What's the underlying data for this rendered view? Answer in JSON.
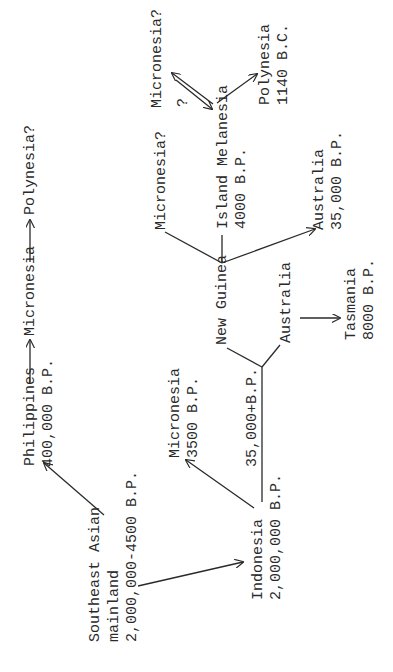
{
  "diagram": {
    "orientation": "rotated 90 degrees counter-clockwise",
    "nodes": {
      "polynesia_q": {
        "label": "Polynesia?"
      },
      "micronesia_chain": {
        "label": "Micronesia"
      },
      "philippines": {
        "label": "Philippines",
        "date": "400,000 B.P."
      },
      "se_asia": {
        "line1": "Southeast Asian",
        "line2": "mainland",
        "date": "2,000,000-4500 B.P."
      },
      "indonesia": {
        "label": "Indonesia",
        "date": "2,000,000 B.P."
      },
      "micronesia_3500": {
        "label": "Micronesia",
        "date": "3500 B.P."
      },
      "edge_35000": {
        "label": "35,000+B.P."
      },
      "new_guinea": {
        "label": "New Guinea"
      },
      "australia_branch": {
        "label": "Australia"
      },
      "tasmania": {
        "label": "Tasmania",
        "date": "8000 B.P."
      },
      "micronesia_q_mid": {
        "label": "Micronesia?"
      },
      "island_melanesia": {
        "label": "Island Melanesia",
        "date": "4000 B.P."
      },
      "australia_35000": {
        "label": "Australia",
        "date": "35,000 B.P."
      },
      "micronesia_q_top": {
        "label": "Micronesia?"
      },
      "question_mark": {
        "label": "?"
      },
      "polynesia_1140": {
        "label": "Polynesia",
        "date": "1140 B.C."
      }
    },
    "edges": [
      {
        "from": "Southeast Asian mainland",
        "to": "Philippines"
      },
      {
        "from": "Southeast Asian mainland",
        "to": "Indonesia"
      },
      {
        "from": "Philippines",
        "to": "Micronesia"
      },
      {
        "from": "Micronesia",
        "to": "Polynesia?"
      },
      {
        "from": "Indonesia",
        "to": "Micronesia (3500 B.P.)"
      },
      {
        "from": "Indonesia",
        "to": "New Guinea / Australia",
        "label": "35,000+B.P."
      },
      {
        "from": "New Guinea",
        "to": "Micronesia?"
      },
      {
        "from": "New Guinea",
        "to": "Island Melanesia"
      },
      {
        "from": "New Guinea",
        "to": "Australia (35,000 B.P.)"
      },
      {
        "from": "Australia",
        "to": "Tasmania"
      },
      {
        "from": "Island Melanesia",
        "to": "Micronesia?",
        "bidirectional": true,
        "label": "?"
      },
      {
        "from": "Island Melanesia",
        "to": "Polynesia"
      }
    ]
  }
}
